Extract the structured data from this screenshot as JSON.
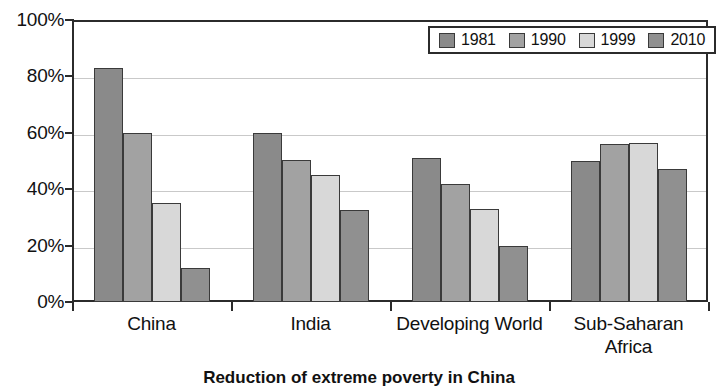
{
  "chart_data": {
    "type": "bar",
    "title": "",
    "caption": "Reduction of extreme poverty in China",
    "xlabel": "",
    "ylabel": "",
    "ylim": [
      0,
      100
    ],
    "ytick_labels": [
      "100%",
      "80%",
      "60%",
      "40%",
      "20%",
      "0%"
    ],
    "ytick_values": [
      100,
      80,
      60,
      40,
      20,
      0
    ],
    "grid": true,
    "legend_position": "top-right-inside",
    "categories": [
      "China",
      "India",
      "Developing World",
      "Sub-Saharan Africa"
    ],
    "series": [
      {
        "name": "1981",
        "color": "#8a8a8a",
        "values": [
          83,
          60,
          51,
          50
        ]
      },
      {
        "name": "1990",
        "color": "#a2a2a2",
        "values": [
          60,
          50.5,
          42,
          56
        ]
      },
      {
        "name": "1999",
        "color": "#d8d8d8",
        "values": [
          35,
          45,
          33,
          56.5
        ]
      },
      {
        "name": "2010",
        "color": "#909090",
        "values": [
          12,
          32.5,
          20,
          47
        ]
      }
    ]
  },
  "legend": {
    "entries": [
      {
        "label": "1981"
      },
      {
        "label": "1990"
      },
      {
        "label": "1999"
      },
      {
        "label": "2010"
      }
    ]
  },
  "axis": {
    "y_labels": [
      "100%",
      "80%",
      "60%",
      "40%",
      "20%",
      "0%"
    ],
    "x_labels": [
      "China",
      "India",
      "Developing World",
      "Sub-Saharan Africa"
    ]
  }
}
